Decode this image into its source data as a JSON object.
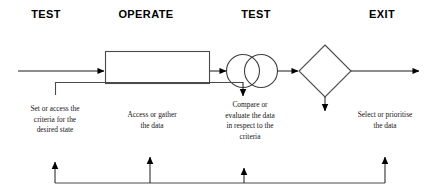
{
  "diagram": {
    "stroke_color": "#3f3f3f",
    "arrow_color": "#000000",
    "text_color": "#161616",
    "header_color": "#000000",
    "background": "#ffffff",
    "stages": [
      {
        "id": "test-1",
        "label": "TEST",
        "x": 46,
        "y": 17
      },
      {
        "id": "operate",
        "label": "OPERATE",
        "x": 146,
        "y": 17
      },
      {
        "id": "test-2",
        "label": "TEST",
        "x": 256,
        "y": 17
      },
      {
        "id": "exit",
        "label": "EXIT",
        "x": 382,
        "y": 17
      }
    ],
    "captions": [
      {
        "id": "caption-set-criteria",
        "text": "Set or access the\ncriteria for the\ndesired state",
        "x": 55,
        "y": 110
      },
      {
        "id": "caption-access-data",
        "text": "Access or gather\nthe data",
        "x": 152,
        "y": 116
      },
      {
        "id": "caption-compare-data",
        "text": "Compare or\nevaluate the data\nin respect to  the\ncriteria",
        "x": 250,
        "y": 105
      },
      {
        "id": "caption-select-data",
        "text": "Select or prioritise\nthe data",
        "x": 385,
        "y": 116
      }
    ],
    "shapes": [
      {
        "id": "operate-process-box",
        "type": "rectangle",
        "x": 105,
        "y": 51,
        "width": 105,
        "height": 33
      },
      {
        "id": "test-circle-left",
        "type": "circle",
        "cx": 243,
        "cy": 71,
        "r": 17
      },
      {
        "id": "test-circle-right",
        "type": "circle",
        "cx": 261,
        "cy": 71,
        "r": 17
      },
      {
        "id": "exit-decision-diamond",
        "type": "diamond",
        "cx": 325,
        "cy": 71,
        "half_width": 26,
        "half_height": 26
      }
    ],
    "connectors": [
      {
        "id": "input-arrow",
        "from": "left-edge",
        "to": "operate-process-box"
      },
      {
        "id": "operate-to-test-arrow",
        "from": "operate-process-box",
        "to": "test-circle-left"
      },
      {
        "id": "test-to-exit-arrow",
        "from": "test-circle-right",
        "to": "exit-decision-diamond"
      },
      {
        "id": "exit-output-arrow",
        "from": "exit-decision-diamond",
        "to": "right-edge"
      },
      {
        "id": "criteria-branch-line",
        "from": "operate-process-box-bottom",
        "to": "caption-set-criteria"
      },
      {
        "id": "test-down-arrow",
        "from": "test-circle-left",
        "to": "caption-compare-data"
      },
      {
        "id": "exit-down-arrow",
        "from": "exit-decision-diamond",
        "to": "caption-select-data"
      }
    ],
    "feedback_bus": {
      "id": "feedback-loop",
      "y": 183,
      "x_start": 55,
      "x_end": 385,
      "arrows": [
        {
          "id": "feedback-arrow-test-1",
          "x": 55,
          "top": 160
        },
        {
          "id": "feedback-arrow-operate",
          "x": 150,
          "top": 155
        },
        {
          "id": "feedback-arrow-test-2",
          "x": 244,
          "top": 166
        },
        {
          "id": "feedback-arrow-exit",
          "x": 385,
          "top": 155
        }
      ]
    }
  }
}
